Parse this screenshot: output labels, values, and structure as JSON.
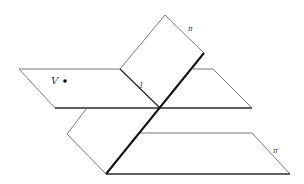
{
  "diagram": {
    "labels": {
      "V": "V",
      "l": "l",
      "pi": "π",
      "pi_prime": "π′"
    },
    "colors": {
      "line": "#6a6a6a",
      "edge": "#2a2a2a",
      "intersection": "#111111",
      "background": "#ffffff"
    },
    "elements": [
      {
        "name": "horizontal-plane",
        "description": "Upper horizontal plane containing point V"
      },
      {
        "name": "vertical-plane-pi",
        "label": "π",
        "description": "Slanted plane π"
      },
      {
        "name": "lower-plane-pi-prime",
        "label": "π′",
        "description": "Lower parallel plane π′"
      },
      {
        "name": "line-l",
        "label": "l",
        "description": "Line l in horizontal plane"
      },
      {
        "name": "point-V",
        "label": "V",
        "description": "Point V"
      }
    ]
  }
}
